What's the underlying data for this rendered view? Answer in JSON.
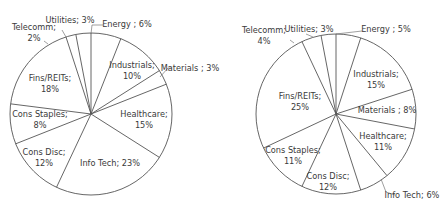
{
  "chart_data": [
    {
      "type": "pie",
      "title": "",
      "start_angle_deg": 0,
      "direction": "clockwise",
      "categories": [
        "Energy",
        "Industrials",
        "Materials",
        "Healthcare",
        "Info Tech",
        "Cons Disc",
        "Cons Staples",
        "Fins/REITs",
        "Telecomm",
        "Utilities"
      ],
      "values": [
        6,
        10,
        3,
        15,
        23,
        12,
        8,
        18,
        2,
        3
      ],
      "labels": [
        "Energy ; 6%",
        "Industrials; 10%",
        "Materials ; 3%",
        "Healthcare; 15%",
        "Info Tech; 23%",
        "Cons Disc; 12%",
        "Cons Staples; 8%",
        "Fins/REITs; 18%",
        "Telecomm; 2%",
        "Utilities; 3%"
      ],
      "center": [
        91,
        114
      ],
      "radius": 81
    },
    {
      "type": "pie",
      "title": "",
      "start_angle_deg": 0,
      "direction": "clockwise",
      "categories": [
        "Energy",
        "Industrials",
        "Materials",
        "Healthcare",
        "Info Tech",
        "Cons Disc",
        "Cons Staples",
        "Fins/REITs",
        "Telecomm",
        "Utilities"
      ],
      "values": [
        5,
        15,
        8,
        11,
        6,
        12,
        11,
        25,
        4,
        3
      ],
      "labels": [
        "Energy ; 5%",
        "Industrials; 15%",
        "Materials ; 8%",
        "Healthcare; 11%",
        "Info Tech; 6%",
        "Cons Disc; 12%",
        "Cons Staples; 11%",
        "Fins/REITs; 25%",
        "Telecomm; 4%",
        "Utilities; 3%"
      ],
      "center": [
        336,
        114
      ],
      "radius": 80
    }
  ],
  "left": {
    "energy": [
      "Energy ; 6%"
    ],
    "industrials": [
      "Industrials;",
      "10%"
    ],
    "materials": [
      "Materials ; 3%"
    ],
    "healthcare": [
      "Healthcare;",
      "15%"
    ],
    "infotech": [
      "Info Tech; 23%"
    ],
    "consdisc": [
      "Cons Disc;",
      "12%"
    ],
    "consstaples": [
      "Cons Staples;",
      "8%"
    ],
    "fins": [
      "Fins/REITs;",
      "18%"
    ],
    "telecomm": [
      "Telecomm;",
      "2%"
    ],
    "utilities": [
      "Utilities; 3%"
    ]
  },
  "right": {
    "energy": [
      "Energy ; 5%"
    ],
    "industrials": [
      "Industrials;",
      "15%"
    ],
    "materials": [
      "Materials ; 8%"
    ],
    "healthcare": [
      "Healthcare;",
      "11%"
    ],
    "infotech": [
      "Info Tech; 6%"
    ],
    "consdisc": [
      "Cons Disc;",
      "12%"
    ],
    "consstaples": [
      "Cons Staples;",
      "11%"
    ],
    "fins": [
      "Fins/REITs;",
      "25%"
    ],
    "telecomm": [
      "Telecomm;",
      "4%"
    ],
    "utilities": [
      "Utilities; 3%"
    ]
  },
  "style": {
    "stroke": "#555555",
    "fill": "#ffffff",
    "text": "#3a3a3a"
  }
}
